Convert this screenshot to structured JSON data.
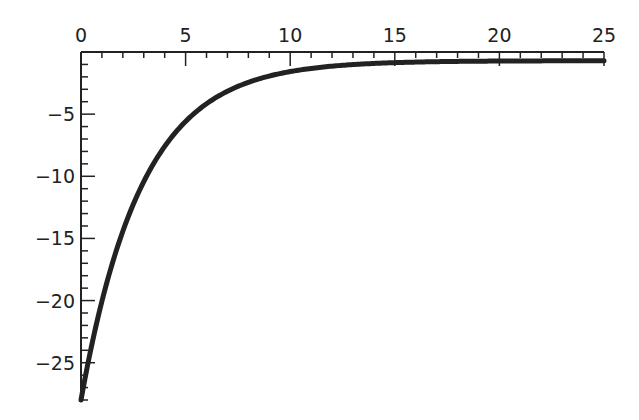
{
  "chart_data": {
    "type": "line",
    "title": "",
    "xlabel": "",
    "ylabel": "",
    "xlim": [
      0,
      25
    ],
    "ylim": [
      -28,
      0
    ],
    "grid": false,
    "legend": null,
    "x_axis_position": "top",
    "x_ticks": [
      0,
      5,
      10,
      15,
      20,
      25
    ],
    "x_tick_labels": [
      "0",
      "5",
      "10",
      "15",
      "20",
      "25"
    ],
    "y_ticks": [
      -5,
      -10,
      -15,
      -20,
      -25
    ],
    "y_tick_labels": [
      "−5",
      "−10",
      "−15",
      "−20",
      "−25"
    ],
    "series": [
      {
        "name": "curve",
        "color": "#222222",
        "x": [
          0,
          1,
          2,
          3,
          4,
          5,
          6,
          7,
          8,
          9,
          10,
          12,
          14,
          16,
          18,
          20,
          22,
          25
        ],
        "y": [
          -28.0,
          -20.0,
          -14.3,
          -10.4,
          -7.6,
          -5.6,
          -4.3,
          -3.4,
          -2.7,
          -2.3,
          -1.6,
          -1.1,
          -0.9,
          -0.8,
          -0.75,
          -0.72,
          -0.71,
          -0.7
        ]
      }
    ]
  }
}
